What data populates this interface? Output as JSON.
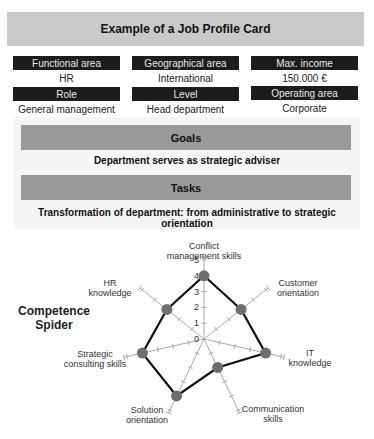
{
  "title": "Example of a Job Profile Card",
  "profile_fields": [
    {
      "label": "Functional area",
      "value": "HR"
    },
    {
      "label": "Geographical area",
      "value": "International"
    },
    {
      "label": "Max. income",
      "value": "150.000 €"
    },
    {
      "label": "Role",
      "value": "General management"
    },
    {
      "label": "Level",
      "value": "Head department"
    },
    {
      "label": "Operating area",
      "value": "Corporate"
    }
  ],
  "goals": {
    "heading": "Goals",
    "text": "Department serves as strategic adviser"
  },
  "tasks": {
    "heading": "Tasks",
    "text": "Transformation of department: from administrative to strategic orientation"
  },
  "spider": {
    "label_line1": "Competence",
    "label_line2": "Spider",
    "scale_ticks": [
      "0",
      "1",
      "2",
      "3",
      "4",
      "5"
    ],
    "axes": [
      {
        "line1": "Conflict",
        "line2": "management skills",
        "value": 4
      },
      {
        "line1": "Customer",
        "line2": "orientation",
        "value": 3
      },
      {
        "line1": "IT",
        "line2": "knowledge",
        "value": 4
      },
      {
        "line1": "Communication",
        "line2": "skills",
        "value": 2
      },
      {
        "line1": "Solution",
        "line2": "orientation",
        "value": 4
      },
      {
        "line1": "Strategic",
        "line2": "consulting skills",
        "value": 4
      },
      {
        "line1": "HR",
        "line2": "knowledge",
        "value": 3
      }
    ]
  },
  "chart_data": {
    "type": "radar",
    "title": "Competence Spider",
    "categories": [
      "Conflict management skills",
      "Customer orientation",
      "IT knowledge",
      "Communication skills",
      "Solution orientation",
      "Strategic consulting skills",
      "HR knowledge"
    ],
    "values": [
      4,
      3,
      4,
      2,
      4,
      4,
      3
    ],
    "range": [
      0,
      5
    ],
    "ticks": [
      0,
      1,
      2,
      3,
      4,
      5
    ]
  },
  "colors": {
    "title_band": "#c9c9c9",
    "field_header": "#1c1c1c",
    "section_band": "#9a9a9a",
    "panel": "#f5f5f5",
    "spider_line": "#111111",
    "spider_dot": "#6e6e6e",
    "axis": "#a8a8a8"
  }
}
